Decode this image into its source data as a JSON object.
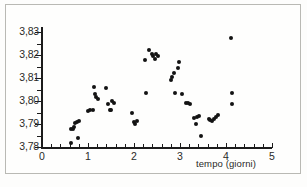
{
  "figure": {
    "name": "scatter-plot-tempo-giorni",
    "background_color": "#fefefd",
    "frame_color": "#b9b9b4",
    "ink_color": "#131313"
  },
  "chart_data": {
    "type": "scatter",
    "title": "",
    "xlabel": "tempo (giorni)",
    "ylabel": "",
    "xlim": [
      0,
      5
    ],
    "ylim": [
      3.78,
      3.83
    ],
    "xticks": [
      0,
      1,
      2,
      3,
      4,
      5
    ],
    "xtick_labels": [
      "0",
      "1",
      "2",
      "3",
      "4",
      "5"
    ],
    "yticks": [
      3.78,
      3.79,
      3.8,
      3.81,
      3.82,
      3.83
    ],
    "ytick_labels": [
      "3,78",
      "3,79",
      "3,80",
      "3,81",
      "3,82",
      "3,83"
    ],
    "y_minor_ticks": [
      3.785,
      3.795,
      3.805,
      3.815,
      3.825
    ],
    "x_minor_ticks": [
      0.2,
      0.4,
      0.6,
      0.8,
      1.2,
      1.4,
      1.6,
      1.8,
      2.2,
      2.4,
      2.6,
      2.8,
      3.2,
      3.4,
      3.6,
      3.8,
      4.2,
      4.4,
      4.6,
      4.8
    ],
    "grid": false,
    "legend": false,
    "marker": "filled-circle",
    "marker_color": "#131313",
    "decimal_separator": ",",
    "series": [
      {
        "name": "misure",
        "points": [
          [
            0.62,
            3.7818
          ],
          [
            0.64,
            3.7878
          ],
          [
            0.67,
            3.788
          ],
          [
            0.7,
            3.7885
          ],
          [
            0.72,
            3.7905
          ],
          [
            0.75,
            3.7908
          ],
          [
            0.78,
            3.784
          ],
          [
            0.8,
            3.7912
          ],
          [
            1.0,
            3.7958
          ],
          [
            1.05,
            3.796
          ],
          [
            1.1,
            3.7962
          ],
          [
            1.12,
            3.806
          ],
          [
            1.16,
            3.8032
          ],
          [
            1.18,
            3.8018
          ],
          [
            1.22,
            3.801
          ],
          [
            1.4,
            3.8058
          ],
          [
            1.44,
            3.7985
          ],
          [
            1.47,
            3.7962
          ],
          [
            1.5,
            3.796
          ],
          [
            1.52,
            3.8002
          ],
          [
            1.56,
            3.7992
          ],
          [
            1.96,
            3.7948
          ],
          [
            1.99,
            3.791
          ],
          [
            2.03,
            3.79
          ],
          [
            2.06,
            3.7912
          ],
          [
            2.23,
            3.818
          ],
          [
            2.27,
            3.8035
          ],
          [
            2.32,
            3.8222
          ],
          [
            2.38,
            3.8205
          ],
          [
            2.42,
            3.8196
          ],
          [
            2.45,
            3.8182
          ],
          [
            2.48,
            3.8205
          ],
          [
            2.52,
            3.8198
          ],
          [
            2.8,
            3.8092
          ],
          [
            2.83,
            3.8105
          ],
          [
            2.86,
            3.8122
          ],
          [
            2.88,
            3.8035
          ],
          [
            2.95,
            3.8142
          ],
          [
            2.98,
            3.817
          ],
          [
            3.05,
            3.803
          ],
          [
            3.12,
            3.7992
          ],
          [
            3.18,
            3.799
          ],
          [
            3.22,
            3.7985
          ],
          [
            3.3,
            3.7925
          ],
          [
            3.34,
            3.79
          ],
          [
            3.36,
            3.7932
          ],
          [
            3.42,
            3.7935
          ],
          [
            3.46,
            3.7848
          ],
          [
            3.62,
            3.792
          ],
          [
            3.66,
            3.7918
          ],
          [
            3.7,
            3.7912
          ],
          [
            3.74,
            3.7922
          ],
          [
            3.78,
            3.793
          ],
          [
            3.82,
            3.7938
          ],
          [
            4.1,
            3.8275
          ],
          [
            4.12,
            3.8035
          ],
          [
            4.14,
            3.7985
          ]
        ]
      }
    ]
  }
}
